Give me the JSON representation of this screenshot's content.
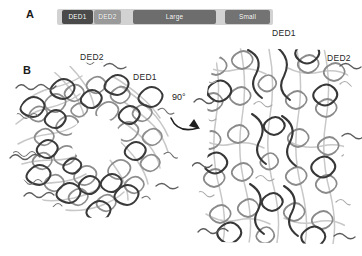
{
  "figure": {
    "background_color": "#ffffff",
    "width": 362,
    "height": 256
  },
  "panel_a": {
    "letter": "A",
    "caption": "Domain architecture bar",
    "bar": {
      "track_color": "#d2d2d2",
      "segments": [
        {
          "label": "DED1",
          "color": "#4a4a4a",
          "left_pct": 2.3,
          "width_pct": 14.4
        },
        {
          "label": "DED2",
          "color": "#9a9a9a",
          "left_pct": 17.1,
          "width_pct": 12.5
        },
        {
          "label": "Large",
          "color": "#6d6d6d",
          "left_pct": 35.2,
          "width_pct": 38.4
        },
        {
          "label": "Small",
          "color": "#737373",
          "left_pct": 77.8,
          "width_pct": 20.8
        }
      ]
    }
  },
  "panel_b": {
    "letter": "B",
    "caption": "Cryo-EM ribbon structures of the helical filament",
    "rotation": {
      "angle_label": "90°",
      "icon": "curved-rotation-arrow"
    },
    "views": [
      {
        "name": "axial-view",
        "description": "Top/axial view of helical filament ring with central pore",
        "labels": [
          {
            "text": "DED2",
            "position": "top"
          },
          {
            "text": "DED1",
            "position": "right"
          }
        ]
      },
      {
        "name": "side-view",
        "description": "Side view of helical filament",
        "labels": [
          {
            "text": "DED1",
            "position": "top"
          },
          {
            "text": "DED2",
            "position": "upper-right"
          }
        ]
      }
    ]
  },
  "colors": {
    "ink": "#262626",
    "ribbon_dark": "#3c3c3c",
    "ribbon_mid": "#7d7d7d",
    "ribbon_light": "#bdbdbd"
  }
}
